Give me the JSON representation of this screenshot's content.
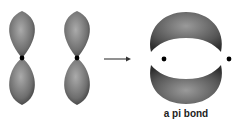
{
  "diagram": {
    "left_label": "two p orbitals",
    "arrow": "right-arrow",
    "caption": "a pi bond",
    "colors": {
      "lobe_light": "#a8a8a8",
      "lobe_dark": "#4a4a4a",
      "nucleus": "#000000",
      "arrow": "#555555",
      "background": "#ffffff"
    }
  }
}
